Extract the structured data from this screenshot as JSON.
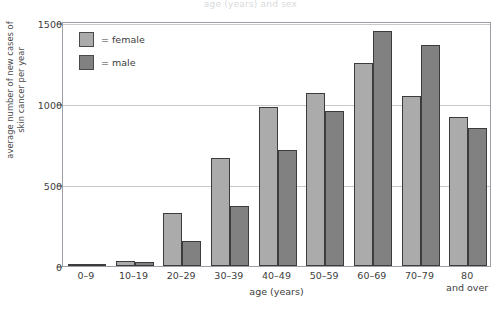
{
  "caption": {
    "clipped_text": "age (years) and sex"
  },
  "chart_data": {
    "type": "bar",
    "title": "",
    "xlabel": "age (years)",
    "ylabel_line1": "average number of new cases of",
    "ylabel_line2": "skin cancer per year",
    "ylim": [
      0,
      1500
    ],
    "yticks": [
      0,
      500,
      1000,
      1500
    ],
    "ytick_labels": [
      "0",
      "500",
      "1000",
      "1500"
    ],
    "grid": true,
    "legend_position": "top-left",
    "categories": [
      "0–9",
      "10–19",
      "20–29",
      "30–39",
      "40–49",
      "50–59",
      "60–69",
      "70–79",
      "80 and over"
    ],
    "category_lines": [
      [
        "0–9"
      ],
      [
        "10–19"
      ],
      [
        "20–29"
      ],
      [
        "30–39"
      ],
      [
        "40–49"
      ],
      [
        "50–59"
      ],
      [
        "60–69"
      ],
      [
        "70–79"
      ],
      [
        "80",
        "and over"
      ]
    ],
    "series": [
      {
        "name": "female",
        "legend_label": "= female",
        "color": "#ababab",
        "values": [
          5,
          30,
          330,
          665,
          980,
          1070,
          1255,
          1050,
          920
        ]
      },
      {
        "name": "male",
        "legend_label": "= male",
        "color": "#818181",
        "values": [
          4,
          25,
          155,
          370,
          715,
          955,
          1450,
          1365,
          850
        ]
      }
    ]
  }
}
